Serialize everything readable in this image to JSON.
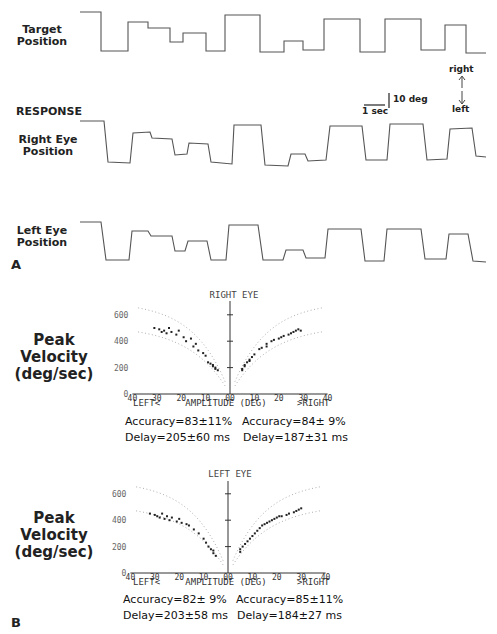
{
  "panel_a": {
    "letter": "A",
    "traces": [
      {
        "label_line1": "Target",
        "label_line2": "Position"
      },
      {
        "label_line1": "Right Eye",
        "label_line2": "Position"
      },
      {
        "label_line1": "Left Eye",
        "label_line2": "Position"
      }
    ],
    "response_label": "RESPONSE",
    "scale_bar": {
      "vertical": "10 deg",
      "horizontal": "1 sec"
    },
    "direction": {
      "up": "right",
      "down": "left"
    }
  },
  "panel_b": {
    "letter": "B",
    "plots": [
      {
        "eye_title": "RIGHT EYE",
        "ylabel_line1": "Peak",
        "ylabel_line2": "Velocity",
        "ylabel_line3": "(deg/sec)",
        "y_ticks": [
          "600",
          "400",
          "200",
          "0"
        ],
        "x_ticks": [
          "40",
          "30",
          "20",
          "10",
          "00",
          "10",
          "20",
          "30",
          "40"
        ],
        "x_left_label": "LEFT<",
        "x_center_label": "AMPLITUDE (DEG)",
        "x_right_label": ">RIGHT",
        "left_stats": {
          "accuracy": "Accuracy=83±11%",
          "delay": "Delay=205±60 ms"
        },
        "right_stats": {
          "accuracy": "Accuracy=84± 9%",
          "delay": "Delay=187±31 ms"
        }
      },
      {
        "eye_title": "LEFT EYE",
        "ylabel_line1": "Peak",
        "ylabel_line2": "Velocity",
        "ylabel_line3": "(deg/sec)",
        "y_ticks": [
          "600",
          "400",
          "200",
          "0"
        ],
        "x_ticks": [
          "40",
          "30",
          "20",
          "10",
          "00",
          "10",
          "20",
          "30",
          "40"
        ],
        "x_left_label": "LEFT<",
        "x_center_label": "AMPLITUDE (DEG)",
        "x_right_label": ">RIGHT",
        "left_stats": {
          "accuracy": "Accuracy=82± 9%",
          "delay": "Delay=203±58 ms"
        },
        "right_stats": {
          "accuracy": "Accuracy=85±11%",
          "delay": "Delay=184±27 ms"
        }
      }
    ]
  },
  "chart_data": [
    {
      "type": "line",
      "title": "Target Position",
      "xlabel": "time",
      "ylabel": "position",
      "note": "step waveform (px y values, lower = more right)",
      "x": [
        80,
        101,
        101,
        128,
        128,
        148,
        148,
        170,
        170,
        183,
        183,
        206,
        206,
        225,
        225,
        260,
        260,
        284,
        284,
        303,
        303,
        324,
        324,
        360,
        360,
        385,
        385,
        421,
        421,
        445,
        445,
        466,
        466,
        486
      ],
      "y": [
        12,
        12,
        51,
        51,
        22,
        22,
        28,
        28,
        42,
        42,
        33,
        33,
        51,
        51,
        15,
        15,
        52,
        52,
        41,
        41,
        50,
        50,
        19,
        19,
        52,
        52,
        19,
        19,
        50,
        50,
        25,
        25,
        53,
        53
      ]
    },
    {
      "type": "line",
      "title": "Right Eye Position",
      "x": [
        80,
        104,
        108,
        130,
        133,
        150,
        152,
        172,
        175,
        187,
        189,
        208,
        211,
        232,
        234,
        261,
        265,
        288,
        291,
        305,
        308,
        326,
        330,
        362,
        366,
        387,
        390,
        423,
        427,
        447,
        450,
        472,
        476,
        486
      ],
      "y": [
        121,
        121,
        162,
        163,
        133,
        132,
        138,
        139,
        155,
        154,
        143,
        144,
        162,
        164,
        125,
        125,
        165,
        166,
        154,
        154,
        161,
        160,
        126,
        126,
        160,
        160,
        124,
        124,
        160,
        159,
        129,
        128,
        156,
        157
      ]
    },
    {
      "type": "line",
      "title": "Left Eye Position",
      "x": [
        80,
        101,
        106,
        129,
        132,
        148,
        151,
        172,
        175,
        185,
        188,
        207,
        211,
        226,
        229,
        258,
        263,
        283,
        286,
        303,
        306,
        325,
        328,
        361,
        365,
        384,
        387,
        421,
        425,
        446,
        449,
        468,
        473,
        486
      ],
      "y": [
        222,
        222,
        260,
        260,
        231,
        231,
        236,
        236,
        251,
        251,
        241,
        241,
        260,
        260,
        225,
        225,
        260,
        260,
        250,
        250,
        258,
        258,
        229,
        229,
        261,
        261,
        229,
        229,
        259,
        259,
        234,
        234,
        261,
        262
      ]
    },
    {
      "type": "scatter",
      "title": "RIGHT EYE",
      "xlabel": "AMPLITUDE (DEG)",
      "ylabel": "Peak Velocity (deg/sec)",
      "xlim": [
        -40,
        40
      ],
      "ylim": [
        0,
        650
      ],
      "series": [
        {
          "name": "leftward saccades",
          "x": [
            -31,
            -29,
            -28,
            -27,
            -26,
            -25,
            -24,
            -22,
            -21,
            -19,
            -18,
            -16,
            -15,
            -14,
            -13,
            -11,
            -10,
            -9,
            -8,
            -7,
            -7,
            -6,
            -6,
            -5
          ],
          "y": [
            500,
            490,
            470,
            480,
            460,
            500,
            470,
            450,
            480,
            430,
            400,
            420,
            360,
            380,
            330,
            310,
            290,
            240,
            230,
            220,
            210,
            200,
            190,
            180
          ]
        },
        {
          "name": "rightward saccades",
          "x": [
            5,
            5,
            6,
            6,
            7,
            8,
            8,
            9,
            10,
            12,
            13,
            15,
            15,
            17,
            18,
            20,
            21,
            22,
            24,
            25,
            26,
            27,
            28,
            29
          ],
          "y": [
            180,
            190,
            210,
            220,
            240,
            250,
            260,
            280,
            300,
            340,
            350,
            360,
            380,
            400,
            410,
            420,
            430,
            440,
            450,
            460,
            470,
            480,
            490,
            480
          ]
        }
      ]
    },
    {
      "type": "scatter",
      "title": "LEFT EYE",
      "xlabel": "AMPLITUDE (DEG)",
      "ylabel": "Peak Velocity (deg/sec)",
      "xlim": [
        -40,
        40
      ],
      "ylim": [
        0,
        650
      ],
      "series": [
        {
          "name": "leftward saccades",
          "x": [
            -32,
            -30,
            -29,
            -28,
            -27,
            -26,
            -25,
            -24,
            -23,
            -21,
            -20,
            -19,
            -17,
            -16,
            -14,
            -12,
            -10,
            -9,
            -8,
            -7,
            -6,
            -6,
            -5
          ],
          "y": [
            450,
            440,
            430,
            420,
            450,
            410,
            430,
            400,
            420,
            390,
            410,
            380,
            370,
            360,
            330,
            300,
            260,
            230,
            200,
            180,
            170,
            150,
            130
          ]
        },
        {
          "name": "rightward saccades",
          "x": [
            5,
            5,
            6,
            7,
            8,
            9,
            10,
            11,
            12,
            13,
            14,
            15,
            16,
            17,
            18,
            19,
            20,
            21,
            22,
            24,
            25,
            27,
            28,
            29,
            30
          ],
          "y": [
            160,
            180,
            200,
            220,
            240,
            260,
            280,
            300,
            320,
            340,
            360,
            370,
            380,
            390,
            400,
            410,
            420,
            430,
            430,
            440,
            450,
            460,
            470,
            480,
            490
          ]
        }
      ]
    }
  ]
}
